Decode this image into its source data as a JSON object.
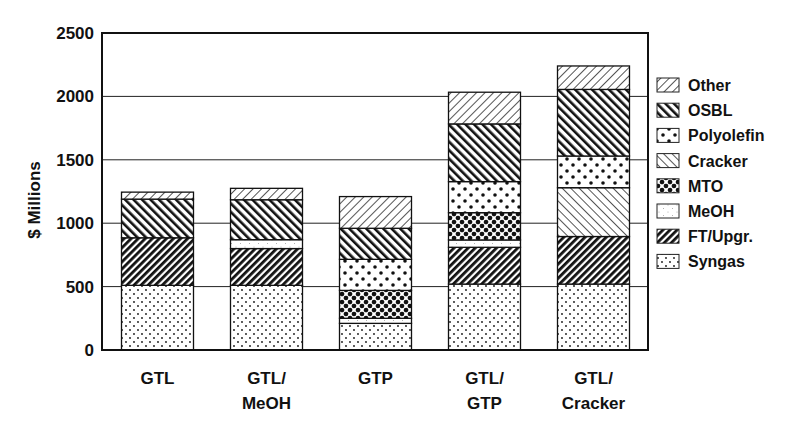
{
  "chart_data": {
    "type": "bar",
    "stacked": true,
    "title": "",
    "xlabel": "",
    "ylabel": "$ Millions",
    "ylim": [
      0,
      2500
    ],
    "yticks": [
      0,
      500,
      1000,
      1500,
      2000,
      2500
    ],
    "grid": true,
    "legend_position": "right",
    "categories": [
      "GTL",
      "GTL/\nMeOH",
      "GTP",
      "GTL/\nGTP",
      "GTL/\nCracker"
    ],
    "category_lines": [
      [
        "GTL"
      ],
      [
        "GTL/",
        "MeOH"
      ],
      [
        "GTP"
      ],
      [
        "GTL/",
        "GTP"
      ],
      [
        "GTL/",
        "Cracker"
      ]
    ],
    "series": [
      {
        "name": "Syngas",
        "pattern": "syngas",
        "values": [
          510,
          510,
          210,
          520,
          520
        ]
      },
      {
        "name": "FT/Upgr.",
        "pattern": "ft",
        "values": [
          375,
          290,
          0,
          290,
          375
        ]
      },
      {
        "name": "MeOH",
        "pattern": "meoh",
        "values": [
          0,
          70,
          40,
          58,
          0
        ]
      },
      {
        "name": "MTO",
        "pattern": "mto",
        "values": [
          0,
          0,
          220,
          215,
          0
        ]
      },
      {
        "name": "Cracker",
        "pattern": "cracker",
        "values": [
          0,
          0,
          0,
          0,
          385
        ]
      },
      {
        "name": "Polyolefin",
        "pattern": "polyolefin",
        "values": [
          0,
          0,
          245,
          245,
          250
        ]
      },
      {
        "name": "OSBL",
        "pattern": "osbl",
        "values": [
          305,
          315,
          245,
          455,
          525
        ]
      },
      {
        "name": "Other",
        "pattern": "other",
        "values": [
          55,
          90,
          250,
          250,
          185
        ]
      }
    ],
    "totals": [
      1245,
      1275,
      1210,
      2033,
      2240
    ],
    "legend": [
      "Other",
      "OSBL",
      "Polyolefin",
      "Cracker",
      "MTO",
      "MeOH",
      "FT/Upgr.",
      "Syngas"
    ]
  }
}
